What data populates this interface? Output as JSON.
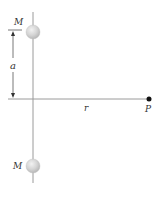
{
  "diagram": {
    "type": "physics-gravitation",
    "labels": {
      "mass_top": "M",
      "mass_bottom": "M",
      "distance_a": "a",
      "distance_r": "r",
      "point": "P"
    },
    "colors": {
      "line": "#9a9a9a",
      "sphere_fill": "#d4d4d4",
      "sphere_highlight": "#f2f2f2",
      "point": "#111111",
      "text": "#333333"
    }
  }
}
